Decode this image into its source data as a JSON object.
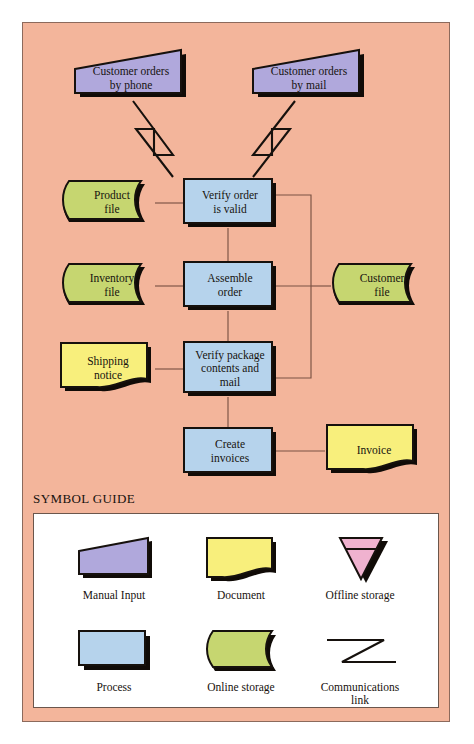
{
  "panel": {
    "background_color": "#f3b59b",
    "border_color": "#8c6a5c"
  },
  "colors": {
    "manual_input_fill": "#b0a8dc",
    "document_fill": "#f8ef7c",
    "offline_storage_fill": "#f0b2cf",
    "process_fill": "#b6d3ec",
    "online_storage_fill": "#c6d670",
    "shape_outline": "#16110d",
    "shadow": "#100b07",
    "connector": "#6b4a3c",
    "comm_link": "#16110d"
  },
  "flowchart": {
    "type": "flowchart",
    "title": "Order processing flowchart",
    "nodes": [
      {
        "id": "orders-phone",
        "label": "Customer orders\nby phone",
        "symbol": "manual-input"
      },
      {
        "id": "orders-mail",
        "label": "Customer orders\nby mail",
        "symbol": "manual-input"
      },
      {
        "id": "product-file",
        "label": "Product\nfile",
        "symbol": "online-storage"
      },
      {
        "id": "verify-order",
        "label": "Verify order\nis valid",
        "symbol": "process"
      },
      {
        "id": "inventory-file",
        "label": "Inventory\nfile",
        "symbol": "online-storage"
      },
      {
        "id": "assemble-order",
        "label": "Assemble\norder",
        "symbol": "process"
      },
      {
        "id": "customer-file",
        "label": "Customer\nfile",
        "symbol": "online-storage"
      },
      {
        "id": "shipping-notice",
        "label": "Shipping\nnotice",
        "symbol": "document"
      },
      {
        "id": "verify-package",
        "label": "Verify package\ncontents and\nmail",
        "symbol": "process"
      },
      {
        "id": "create-invoices",
        "label": "Create\ninvoices",
        "symbol": "process"
      },
      {
        "id": "invoice",
        "label": "Invoice",
        "symbol": "document"
      }
    ],
    "edges": [
      {
        "from": "orders-phone",
        "to": "verify-order",
        "kind": "communications-link"
      },
      {
        "from": "orders-mail",
        "to": "verify-order",
        "kind": "communications-link"
      },
      {
        "from": "product-file",
        "to": "verify-order",
        "kind": "line"
      },
      {
        "from": "verify-order",
        "to": "assemble-order",
        "kind": "line"
      },
      {
        "from": "inventory-file",
        "to": "assemble-order",
        "kind": "line"
      },
      {
        "from": "assemble-order",
        "to": "verify-package",
        "kind": "line"
      },
      {
        "from": "shipping-notice",
        "to": "verify-package",
        "kind": "line"
      },
      {
        "from": "verify-package",
        "to": "create-invoices",
        "kind": "line"
      },
      {
        "from": "create-invoices",
        "to": "invoice",
        "kind": "line"
      },
      {
        "from": "verify-order",
        "to": "customer-file",
        "kind": "bus"
      },
      {
        "from": "assemble-order",
        "to": "customer-file",
        "kind": "bus"
      },
      {
        "from": "verify-package",
        "to": "customer-file",
        "kind": "bus"
      }
    ]
  },
  "symbol_guide": {
    "title": "SYMBOL GUIDE",
    "items": [
      {
        "symbol": "manual-input",
        "label": "Manual Input"
      },
      {
        "symbol": "document",
        "label": "Document"
      },
      {
        "symbol": "offline-storage",
        "label": "Offline storage"
      },
      {
        "symbol": "process",
        "label": "Process"
      },
      {
        "symbol": "online-storage",
        "label": "Online storage"
      },
      {
        "symbol": "communications-link",
        "label": "Communications\nlink"
      }
    ]
  }
}
